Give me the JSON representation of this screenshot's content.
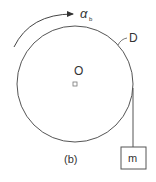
{
  "figure": {
    "caption": "(b)",
    "labels": {
      "angular_accel": "α",
      "angular_accel_sub": "b",
      "disk": "D",
      "center": "O",
      "mass": "m"
    },
    "colors": {
      "stroke": "#444444",
      "text": "#333333"
    },
    "geometry": {
      "disk_center": [
        75,
        84
      ],
      "disk_radius": 58,
      "mass_box": {
        "x": 121,
        "y": 147,
        "w": 25,
        "h": 22
      }
    }
  }
}
